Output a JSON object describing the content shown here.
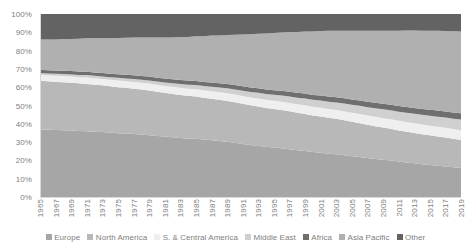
{
  "chart_data": {
    "type": "area",
    "stacked": "100%",
    "title": "",
    "subtitle": "",
    "xlabel": "",
    "ylabel": "",
    "ylim": [
      0,
      100
    ],
    "grid": false,
    "legend_position": "bottom",
    "y_tick_labels": [
      "100%",
      "90%",
      "80%",
      "70%",
      "60%",
      "50%",
      "40%",
      "30%",
      "20%",
      "10%",
      "0%"
    ],
    "y_tick_values": [
      100,
      90,
      80,
      70,
      60,
      50,
      40,
      30,
      20,
      10,
      0
    ],
    "x_tick_labels": [
      "1965",
      "1967",
      "1969",
      "1971",
      "1973",
      "1975",
      "1977",
      "1979",
      "1981",
      "1983",
      "1985",
      "1987",
      "1989",
      "1991",
      "1993",
      "1995",
      "1997",
      "1999",
      "2001",
      "2003",
      "2005",
      "2007",
      "2009",
      "2011",
      "2013",
      "2015",
      "2017",
      "2019"
    ],
    "x": [
      1965,
      1966,
      1967,
      1968,
      1969,
      1970,
      1971,
      1972,
      1973,
      1974,
      1975,
      1976,
      1977,
      1978,
      1979,
      1980,
      1981,
      1982,
      1983,
      1984,
      1985,
      1986,
      1987,
      1988,
      1989,
      1990,
      1991,
      1992,
      1993,
      1994,
      1995,
      1996,
      1997,
      1998,
      1999,
      2000,
      2001,
      2002,
      2003,
      2004,
      2005,
      2006,
      2007,
      2008,
      2009,
      2010,
      2011,
      2012,
      2013,
      2014,
      2015,
      2016,
      2017,
      2018,
      2019
    ],
    "series": [
      {
        "name": "Europe",
        "color": "#a6a6a6",
        "values": [
          37.0,
          36.8,
          36.6,
          36.5,
          36.3,
          36.1,
          35.9,
          35.7,
          35.5,
          35.2,
          34.9,
          34.7,
          34.4,
          34.1,
          33.8,
          33.4,
          33.0,
          32.6,
          32.3,
          32.0,
          31.8,
          31.4,
          31.0,
          30.6,
          30.2,
          29.7,
          29.0,
          28.4,
          27.9,
          27.4,
          27.0,
          26.6,
          26.1,
          25.6,
          25.1,
          24.6,
          24.2,
          23.7,
          23.3,
          22.8,
          22.3,
          21.8,
          21.3,
          20.8,
          20.4,
          20.0,
          19.4,
          18.9,
          18.4,
          17.9,
          17.5,
          17.1,
          16.7,
          16.2,
          15.8
        ]
      },
      {
        "name": "North America",
        "color": "#b8b8b8",
        "values": [
          26.5,
          26.4,
          26.3,
          26.2,
          26.1,
          26.0,
          25.9,
          25.7,
          25.5,
          25.3,
          25.1,
          25.0,
          24.8,
          24.6,
          24.4,
          24.1,
          23.9,
          23.7,
          23.5,
          23.3,
          23.1,
          22.9,
          22.7,
          22.5,
          22.3,
          22.1,
          21.9,
          21.7,
          21.5,
          21.3,
          21.1,
          20.9,
          20.7,
          20.5,
          20.3,
          20.0,
          19.8,
          19.6,
          19.4,
          19.1,
          18.8,
          18.5,
          18.2,
          17.9,
          17.6,
          17.3,
          17.0,
          16.8,
          16.6,
          16.4,
          16.2,
          16.0,
          15.8,
          15.6,
          15.4
        ]
      },
      {
        "name": "S. & Central America",
        "color": "#efefef",
        "values": [
          3.3,
          3.3,
          3.3,
          3.4,
          3.4,
          3.4,
          3.5,
          3.5,
          3.5,
          3.6,
          3.6,
          3.6,
          3.7,
          3.7,
          3.8,
          3.8,
          3.8,
          3.9,
          3.9,
          3.9,
          4.0,
          4.0,
          4.1,
          4.1,
          4.2,
          4.2,
          4.3,
          4.3,
          4.4,
          4.4,
          4.5,
          4.5,
          4.6,
          4.6,
          4.7,
          4.7,
          4.8,
          4.8,
          4.8,
          4.9,
          4.9,
          5.0,
          5.0,
          5.1,
          5.1,
          5.2,
          5.2,
          5.3,
          5.3,
          5.3,
          5.3,
          5.3,
          5.3,
          5.3,
          5.3
        ]
      },
      {
        "name": "Middle East",
        "color": "#d0d0d0",
        "values": [
          1.0,
          1.0,
          1.1,
          1.1,
          1.2,
          1.2,
          1.3,
          1.3,
          1.4,
          1.4,
          1.5,
          1.5,
          1.6,
          1.7,
          1.7,
          1.8,
          1.9,
          2.0,
          2.1,
          2.2,
          2.3,
          2.4,
          2.5,
          2.6,
          2.7,
          2.8,
          2.9,
          3.0,
          3.1,
          3.2,
          3.3,
          3.4,
          3.5,
          3.6,
          3.7,
          3.8,
          3.9,
          4.0,
          4.2,
          4.3,
          4.4,
          4.5,
          4.6,
          4.7,
          4.8,
          4.9,
          5.0,
          5.1,
          5.2,
          5.3,
          5.4,
          5.5,
          5.6,
          5.7,
          5.8
        ]
      },
      {
        "name": "Africa",
        "color": "#6f6f6f",
        "values": [
          1.8,
          1.8,
          1.8,
          1.8,
          1.8,
          1.9,
          1.9,
          1.9,
          1.9,
          1.9,
          2.0,
          2.0,
          2.0,
          2.0,
          2.1,
          2.1,
          2.1,
          2.1,
          2.2,
          2.2,
          2.2,
          2.2,
          2.3,
          2.3,
          2.3,
          2.4,
          2.4,
          2.4,
          2.5,
          2.5,
          2.5,
          2.6,
          2.6,
          2.6,
          2.7,
          2.7,
          2.7,
          2.8,
          2.8,
          2.8,
          2.9,
          2.9,
          2.9,
          3.0,
          3.0,
          3.0,
          3.1,
          3.1,
          3.2,
          3.2,
          3.3,
          3.3,
          3.3,
          3.4,
          3.4
        ]
      },
      {
        "name": "Asia Pacific",
        "color": "#b0b0b0",
        "values": [
          16.4,
          16.7,
          17.0,
          17.3,
          17.6,
          17.9,
          18.2,
          18.6,
          19.0,
          19.4,
          19.8,
          20.2,
          20.6,
          21.0,
          21.4,
          21.9,
          22.4,
          22.9,
          23.4,
          23.9,
          24.4,
          25.0,
          25.6,
          26.2,
          26.8,
          27.5,
          28.3,
          29.1,
          29.8,
          30.5,
          31.2,
          31.9,
          32.6,
          33.3,
          34.0,
          34.7,
          35.3,
          35.9,
          36.4,
          37.0,
          37.6,
          38.2,
          38.8,
          39.4,
          40.0,
          40.5,
          41.2,
          41.8,
          42.3,
          42.8,
          43.2,
          43.6,
          44.0,
          44.4,
          44.8
        ]
      },
      {
        "name": "Other",
        "color": "#636363",
        "values": [
          14.0,
          14.0,
          13.9,
          13.7,
          13.6,
          13.5,
          13.3,
          13.3,
          13.2,
          13.2,
          13.1,
          13.0,
          12.9,
          12.9,
          12.8,
          12.9,
          12.9,
          12.8,
          12.6,
          12.5,
          12.2,
          12.1,
          11.8,
          11.7,
          11.5,
          11.3,
          11.2,
          11.1,
          10.8,
          10.7,
          10.4,
          10.1,
          9.9,
          9.8,
          9.5,
          9.5,
          9.3,
          9.2,
          9.1,
          9.1,
          9.1,
          9.1,
          9.2,
          9.1,
          9.1,
          9.1,
          9.1,
          9.0,
          9.0,
          9.1,
          9.1,
          9.2,
          9.3,
          9.4,
          9.5
        ]
      }
    ]
  },
  "legend": {
    "items": [
      {
        "label": "Europe",
        "color": "#a6a6a6"
      },
      {
        "label": "North America",
        "color": "#b8b8b8"
      },
      {
        "label": "S. & Central America",
        "color": "#efefef"
      },
      {
        "label": "Middle East",
        "color": "#d0d0d0"
      },
      {
        "label": "Africa",
        "color": "#6f6f6f"
      },
      {
        "label": "Asia Pacific",
        "color": "#b0b0b0"
      },
      {
        "label": "Other",
        "color": "#636363"
      }
    ]
  },
  "axis": {
    "line_color": "#d9d9d9",
    "text_color": "#808080"
  }
}
